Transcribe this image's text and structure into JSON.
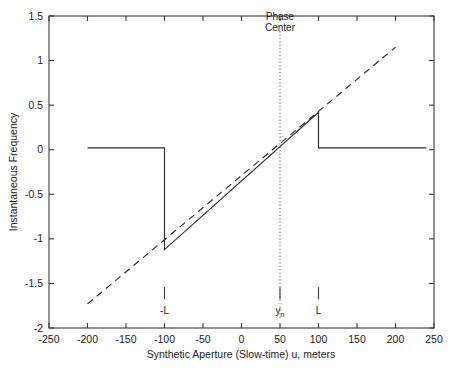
{
  "chart_data": {
    "type": "line",
    "title": "",
    "xlabel": "Synthetic Aperture (Slow-time) u, meters",
    "ylabel": "Instantaneous Frequency",
    "xlim": [
      -250,
      250
    ],
    "ylim": [
      -2,
      1.5
    ],
    "grid": false,
    "legend": null,
    "xticks": [
      -250,
      -200,
      -150,
      -100,
      -50,
      0,
      50,
      100,
      150,
      200,
      250
    ],
    "xticklabels": [
      "-250",
      "-200",
      "-150",
      "-100",
      "-50",
      "0",
      "50",
      "100",
      "150",
      "200",
      "250"
    ],
    "yticks": [
      1.5,
      1,
      0.5,
      0,
      -0.5,
      -1,
      -1.5,
      -2
    ],
    "yticklabels": [
      "1.5",
      "1",
      "0.5",
      "0",
      "-0.5",
      "-1",
      "-1.5",
      "-2"
    ],
    "series": [
      {
        "name": "instantaneous-frequency-wrapped",
        "style": "solid",
        "comment": "Flat zero outside aperture with sawtooth jumps at +/-L",
        "points": [
          [
            -200,
            0.02
          ],
          [
            -100,
            0.02
          ],
          [
            -100,
            -1.12
          ],
          [
            100,
            0.42
          ],
          [
            100,
            0.02
          ],
          [
            240,
            0.02
          ]
        ]
      },
      {
        "name": "instantaneous-frequency-unwrapped",
        "style": "dashed",
        "comment": "Underlying linear chirp through phase center",
        "points": [
          [
            -200,
            -1.73
          ],
          [
            200,
            1.15
          ]
        ]
      }
    ],
    "annotations": [
      {
        "name": "phase-center",
        "label_lines": [
          "Phase",
          "Center"
        ],
        "x": 50,
        "line_from_y": 1.33,
        "line_to_y": -1.9,
        "style": "dotted-vertical"
      },
      {
        "name": "aperture-start-marker",
        "label": "-L",
        "sub": "",
        "x": -100,
        "y": -1.62
      },
      {
        "name": "phase-center-marker",
        "label": "y",
        "sub": "n",
        "x": 50,
        "y": -1.62
      },
      {
        "name": "aperture-end-marker",
        "label": "L",
        "sub": "",
        "x": 100,
        "y": -1.62
      }
    ],
    "colors": {
      "axis": "#3a3a3a",
      "series": "#2b2b2b",
      "phase_line": "#5a5a5a",
      "background": "#ffffff"
    }
  }
}
